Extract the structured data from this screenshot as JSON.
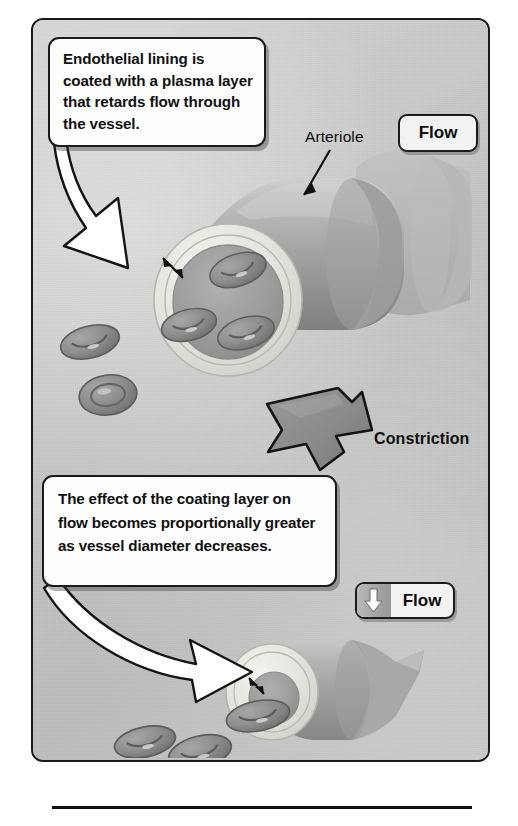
{
  "figure": {
    "domain": "anatomical-diagram",
    "panel": {
      "background_color": "#c6c6c6",
      "border_color": "#1b1b1b"
    },
    "callouts": [
      {
        "id": "callout-1",
        "text": "Endothelial lining is coated with a plasma layer that retards flow through the vessel.",
        "lines": [
          "Endothelial lining is",
          "coated with a plasma",
          "layer that retards flow",
          "through the vessel."
        ],
        "points_to": "large-arteriole-lumen"
      },
      {
        "id": "callout-2",
        "text": "The effect of the coating layer on flow becomes proportionally greater as vessel diameter decreases.",
        "lines": [
          "The effect of the coating layer",
          "on flow becomes",
          "proportionally greater as",
          "vessel diameter decreases."
        ],
        "points_to": "constricted-arteriole-lumen"
      }
    ],
    "chips": [
      {
        "id": "flow-chip-top",
        "label": "Flow",
        "has_arrow_icon": false
      },
      {
        "id": "flow-chip-bottom",
        "label": "Flow",
        "has_arrow_icon": true,
        "arrow_direction": "down"
      }
    ],
    "labels": [
      {
        "id": "arteriole-label",
        "text": "Arteriole",
        "bold": false,
        "leader": "arrow pointing down-left to vessel wall"
      },
      {
        "id": "constriction-label",
        "text": "Constriction",
        "bold": true,
        "leader": "thick grey block arrow pointing down-right"
      }
    ],
    "vessels": [
      {
        "id": "large-arteriole",
        "state": "dilated",
        "wall_color": "#e8e7e2",
        "lumen_color": "#9d9d9d",
        "body_color": "#a9a9a9",
        "red_blood_cells_in_lumen": 3,
        "plasma_layer_marker": "double-headed arrow across wall-to-lumen gap"
      },
      {
        "id": "constricted-arteriole",
        "state": "constricted",
        "wall_color": "#e8e7e2",
        "lumen_color": "#9d9d9d",
        "body_color": "#a6a6a6",
        "red_blood_cells_in_lumen": 1,
        "plasma_layer_marker": "double-headed arrow across wall-to-lumen gap"
      }
    ],
    "free_red_blood_cells": {
      "near_large_vessel": 2,
      "near_constricted_vessel": 2,
      "shape": "biconcave disc"
    },
    "colors": {
      "panel_bg": "#c6c6c6",
      "vessel_wall": "#e8e7e2",
      "vessel_body": "#a9a9a9",
      "lumen": "#9d9d9d",
      "rbc": "#8a8a8a",
      "outline": "#1b1b1b",
      "callout_bg": "#fdfdfd",
      "chip_bg": "#f2f2f2",
      "constriction_arrow": "#8c8c8c"
    }
  }
}
